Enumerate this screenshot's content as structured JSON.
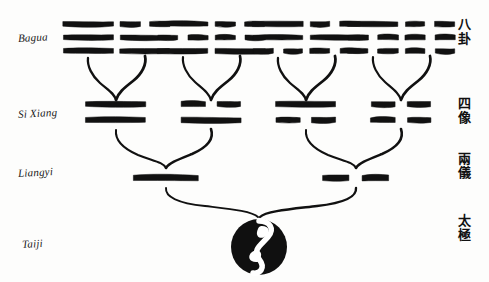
{
  "diagram": {
    "background_color": "#fdfdfc",
    "ink_color": "#111111",
    "rows": [
      {
        "id": "bagua",
        "label_latin": "Bagua",
        "label_chinese": "八卦",
        "chinese_chars": [
          "八",
          "卦"
        ],
        "lines_per_figure": 3,
        "figures": [
          {
            "name": "qian",
            "lines": [
              "solid",
              "solid",
              "solid"
            ]
          },
          {
            "name": "dui",
            "lines": [
              "broken",
              "solid",
              "solid"
            ]
          },
          {
            "name": "li",
            "lines": [
              "solid",
              "broken",
              "solid"
            ]
          },
          {
            "name": "zhen",
            "lines": [
              "broken",
              "broken",
              "solid"
            ]
          },
          {
            "name": "xun",
            "lines": [
              "solid",
              "solid",
              "broken"
            ]
          },
          {
            "name": "kan",
            "lines": [
              "broken",
              "solid",
              "broken"
            ]
          },
          {
            "name": "gen",
            "lines": [
              "solid",
              "broken",
              "broken"
            ]
          },
          {
            "name": "kun",
            "lines": [
              "broken",
              "broken",
              "broken"
            ]
          }
        ]
      },
      {
        "id": "sixiang",
        "label_latin": "Si Xiang",
        "label_chinese": "四像",
        "chinese_chars": [
          "四",
          "像"
        ],
        "lines_per_figure": 2,
        "figures": [
          {
            "name": "taiyang",
            "lines": [
              "solid",
              "solid"
            ]
          },
          {
            "name": "shaoyin",
            "lines": [
              "broken",
              "solid"
            ]
          },
          {
            "name": "shaoyang",
            "lines": [
              "solid",
              "broken"
            ]
          },
          {
            "name": "taiyin",
            "lines": [
              "broken",
              "broken"
            ]
          }
        ]
      },
      {
        "id": "liangyi",
        "label_latin": "Liangyi",
        "label_chinese": "兩儀",
        "chinese_chars": [
          "兩",
          "儀"
        ],
        "lines_per_figure": 1,
        "figures": [
          {
            "name": "yang",
            "lines": [
              "solid"
            ]
          },
          {
            "name": "yin",
            "lines": [
              "broken"
            ]
          }
        ]
      },
      {
        "id": "taiji",
        "label_latin": "Taiji",
        "label_chinese": "太極",
        "chinese_chars": [
          "太",
          "極"
        ],
        "lines_per_figure": 0,
        "figures": [
          {
            "name": "taiji-symbol",
            "lines": []
          }
        ]
      }
    ]
  }
}
